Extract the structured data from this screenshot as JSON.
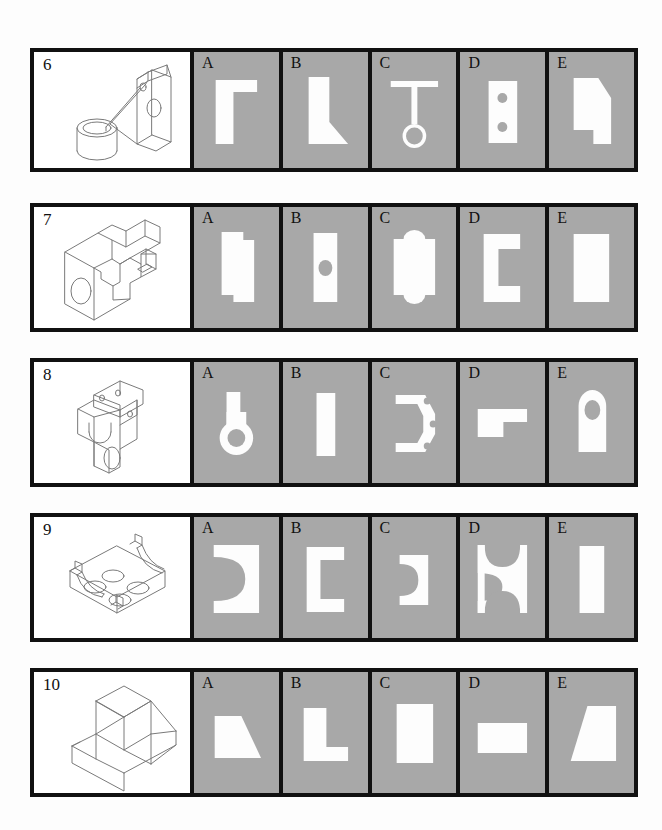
{
  "page": {
    "background_color": "#fdfdfd",
    "panel_background_color": "#a8a8a8",
    "shape_color": "#fdfdfd",
    "border_color": "#111111",
    "line_color": "#7a7a7a"
  },
  "option_labels": [
    "A",
    "B",
    "C",
    "D",
    "E"
  ],
  "rows": [
    {
      "number": "6",
      "pictorial_name": "isometric-bracket-with-cylinder-boss",
      "options": [
        {
          "label": "A",
          "shape_name": "L-shaped-flange-view"
        },
        {
          "label": "B",
          "shape_name": "tapered-gusset-view"
        },
        {
          "label": "C",
          "shape_name": "tee-with-circle-view"
        },
        {
          "label": "D",
          "shape_name": "rectangle-with-two-holes-view"
        },
        {
          "label": "E",
          "shape_name": "chamfered-notched-block-view"
        }
      ]
    },
    {
      "number": "7",
      "pictorial_name": "isometric-slotted-vee-block",
      "options": [
        {
          "label": "A",
          "shape_name": "stepped-rectangle-view"
        },
        {
          "label": "B",
          "shape_name": "rectangle-with-center-hole-view"
        },
        {
          "label": "C",
          "shape_name": "rectangle-with-lobes-view"
        },
        {
          "label": "D",
          "shape_name": "c-channel-view"
        },
        {
          "label": "E",
          "shape_name": "plain-rectangle-view"
        }
      ]
    },
    {
      "number": "8",
      "pictorial_name": "isometric-angled-link-bracket",
      "options": [
        {
          "label": "A",
          "shape_name": "keyhole-lobe-view"
        },
        {
          "label": "B",
          "shape_name": "narrow-rectangle-view"
        },
        {
          "label": "C",
          "shape_name": "bracket-with-three-holes-view"
        },
        {
          "label": "D",
          "shape_name": "stepped-ell-view"
        },
        {
          "label": "E",
          "shape_name": "rounded-end-slot-with-hole-view"
        }
      ]
    },
    {
      "number": "9",
      "pictorial_name": "isometric-four-hole-base-with-curved-arms",
      "options": [
        {
          "label": "A",
          "shape_name": "rectangle-with-large-concave-arc-view"
        },
        {
          "label": "B",
          "shape_name": "c-bracket-view"
        },
        {
          "label": "C",
          "shape_name": "small-rectangle-with-arc-view"
        },
        {
          "label": "D",
          "shape_name": "double-concave-waist-view"
        },
        {
          "label": "E",
          "shape_name": "plain-tall-rectangle-view"
        }
      ]
    },
    {
      "number": "10",
      "pictorial_name": "isometric-tapered-block-with-rib",
      "options": [
        {
          "label": "A",
          "shape_name": "right-trapezoid-view"
        },
        {
          "label": "B",
          "shape_name": "ell-shape-view"
        },
        {
          "label": "C",
          "shape_name": "upright-rectangle-view"
        },
        {
          "label": "D",
          "shape_name": "wide-short-rectangle-view"
        },
        {
          "label": "E",
          "shape_name": "isosceles-trapezoid-view"
        }
      ]
    }
  ]
}
